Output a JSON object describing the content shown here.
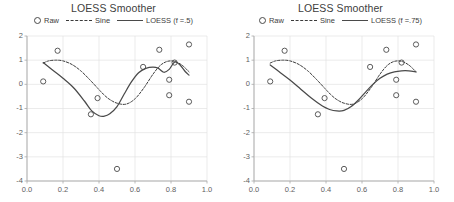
{
  "figure": {
    "panels": [
      {
        "id": "left",
        "title": "LOESS Smoother",
        "legend": [
          {
            "icon": "circle-marker-icon",
            "label": "Raw"
          },
          {
            "icon": "dashed-line-icon",
            "label": "Sine"
          },
          {
            "icon": "solid-line-icon",
            "label": "LOESS (f =.5)"
          }
        ]
      },
      {
        "id": "right",
        "title": "LOESS Smoother",
        "legend": [
          {
            "icon": "circle-marker-icon",
            "label": "Raw"
          },
          {
            "icon": "dashed-line-icon",
            "label": "Sine"
          },
          {
            "icon": "solid-line-icon",
            "label": "LOESS (f =.75)"
          }
        ]
      }
    ]
  },
  "chart_data": [
    {
      "type": "scatter",
      "title": "LOESS Smoother",
      "xlabel": "",
      "ylabel": "",
      "xlim": [
        0.0,
        1.0
      ],
      "ylim": [
        -4,
        2
      ],
      "xticks": [
        "0.0",
        "0.2",
        "0.4",
        "0.6",
        "0.8",
        "1.0"
      ],
      "xtick_values": [
        0.0,
        0.2,
        0.4,
        0.6,
        0.8,
        1.0
      ],
      "yticks": [
        "2",
        "1",
        "0",
        "-1",
        "-2",
        "-3",
        "-4"
      ],
      "ytick_values": [
        2,
        1,
        0,
        -1,
        -2,
        -3,
        -4
      ],
      "grid": true,
      "legend_position": "top-center",
      "series": [
        {
          "name": "Raw",
          "type": "scatter",
          "marker": "open-circle",
          "color": "#4a4a4a",
          "points": [
            [
              0.09,
              0.12
            ],
            [
              0.17,
              1.39
            ],
            [
              0.355,
              -1.24
            ],
            [
              0.392,
              -0.57
            ],
            [
              0.5,
              -3.5
            ],
            [
              0.645,
              0.72
            ],
            [
              0.735,
              1.43
            ],
            [
              0.79,
              0.19
            ],
            [
              0.79,
              -0.45
            ],
            [
              0.82,
              0.9
            ],
            [
              0.9,
              1.65
            ],
            [
              0.9,
              -0.72
            ]
          ]
        },
        {
          "name": "Sine",
          "type": "line",
          "style": "dashed",
          "color": "#3a3a3a",
          "x": [
            0.09,
            0.12,
            0.16,
            0.2,
            0.25,
            0.3,
            0.35,
            0.4,
            0.43,
            0.46,
            0.5,
            0.55,
            0.6,
            0.65,
            0.7,
            0.74,
            0.78,
            0.82,
            0.86,
            0.9
          ],
          "y": [
            0.88,
            0.97,
            1.0,
            0.97,
            0.82,
            0.55,
            0.18,
            -0.22,
            -0.45,
            -0.63,
            -0.78,
            -0.82,
            -0.6,
            -0.14,
            0.42,
            0.78,
            0.95,
            0.95,
            0.8,
            0.52
          ]
        },
        {
          "name": "LOESS (f =.5)",
          "type": "line",
          "style": "solid",
          "color": "#4a4a4a",
          "x": [
            0.09,
            0.14,
            0.2,
            0.26,
            0.32,
            0.36,
            0.4,
            0.43,
            0.46,
            0.5,
            0.54,
            0.58,
            0.62,
            0.66,
            0.7,
            0.73,
            0.76,
            0.79,
            0.82,
            0.85,
            0.88,
            0.9
          ],
          "y": [
            0.9,
            0.6,
            0.25,
            -0.15,
            -0.7,
            -1.1,
            -1.3,
            -1.32,
            -1.22,
            -0.92,
            -0.4,
            0.1,
            0.48,
            0.66,
            0.71,
            0.66,
            0.5,
            0.62,
            0.92,
            0.8,
            0.52,
            0.38
          ]
        }
      ]
    },
    {
      "type": "scatter",
      "title": "LOESS Smoother",
      "xlabel": "",
      "ylabel": "",
      "xlim": [
        0.0,
        1.0
      ],
      "ylim": [
        -4,
        2
      ],
      "xticks": [
        "0.0",
        "0.2",
        "0.4",
        "0.6",
        "0.8",
        "1.0"
      ],
      "xtick_values": [
        0.0,
        0.2,
        0.4,
        0.6,
        0.8,
        1.0
      ],
      "yticks": [
        "2",
        "1",
        "0",
        "-1",
        "-2",
        "-3",
        "-4"
      ],
      "ytick_values": [
        2,
        1,
        0,
        -1,
        -2,
        -3,
        -4
      ],
      "grid": true,
      "legend_position": "top-center",
      "series": [
        {
          "name": "Raw",
          "type": "scatter",
          "marker": "open-circle",
          "color": "#4a4a4a",
          "points": [
            [
              0.09,
              0.12
            ],
            [
              0.17,
              1.39
            ],
            [
              0.355,
              -1.24
            ],
            [
              0.392,
              -0.57
            ],
            [
              0.5,
              -3.5
            ],
            [
              0.645,
              0.72
            ],
            [
              0.735,
              1.43
            ],
            [
              0.79,
              0.19
            ],
            [
              0.79,
              -0.45
            ],
            [
              0.82,
              0.9
            ],
            [
              0.9,
              1.65
            ],
            [
              0.9,
              -0.72
            ]
          ]
        },
        {
          "name": "Sine",
          "type": "line",
          "style": "dashed",
          "color": "#3a3a3a",
          "x": [
            0.09,
            0.12,
            0.16,
            0.2,
            0.25,
            0.3,
            0.35,
            0.4,
            0.43,
            0.46,
            0.5,
            0.55,
            0.6,
            0.65,
            0.7,
            0.74,
            0.78,
            0.82,
            0.86,
            0.9
          ],
          "y": [
            0.88,
            0.97,
            1.0,
            0.97,
            0.82,
            0.55,
            0.18,
            -0.22,
            -0.45,
            -0.63,
            -0.78,
            -0.82,
            -0.6,
            -0.14,
            0.42,
            0.78,
            0.95,
            0.95,
            0.8,
            0.52
          ]
        },
        {
          "name": "LOESS (f =.75)",
          "type": "line",
          "style": "solid",
          "color": "#4a4a4a",
          "x": [
            0.09,
            0.14,
            0.2,
            0.26,
            0.32,
            0.38,
            0.42,
            0.46,
            0.5,
            0.54,
            0.58,
            0.62,
            0.66,
            0.7,
            0.74,
            0.78,
            0.82,
            0.86,
            0.9
          ],
          "y": [
            0.8,
            0.52,
            0.18,
            -0.2,
            -0.58,
            -0.9,
            -1.04,
            -1.1,
            -1.08,
            -0.92,
            -0.65,
            -0.32,
            0.0,
            0.25,
            0.42,
            0.52,
            0.56,
            0.56,
            0.52
          ]
        }
      ]
    }
  ]
}
